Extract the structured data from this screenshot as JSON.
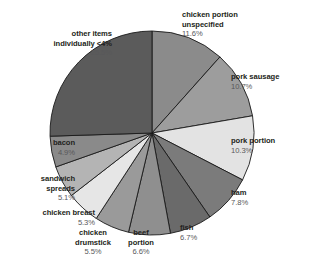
{
  "chart_data": {
    "type": "pie",
    "title": "",
    "subtitle": "",
    "xlabel": "",
    "ylabel": "",
    "legend_position": "none",
    "grid": false,
    "unit": "%",
    "start_angle_deg": 0,
    "direction": "clockwise",
    "categories": [
      "chicken portion unspecified",
      "pork sausage",
      "pork portion",
      "ham",
      "fish",
      "beef portion",
      "chicken drumstick",
      "chicken breast",
      "sandwich spreads",
      "bacon",
      "other items individually <4%"
    ],
    "values": [
      11.6,
      10.7,
      10.3,
      7.8,
      6.7,
      6.6,
      5.5,
      5.3,
      5.1,
      4.9,
      25.5
    ],
    "slices": [
      {
        "id": "chicken-portion-unspecified",
        "label_line1": "chicken portion",
        "label_line2": "unspecified",
        "percent_text": "11.6%",
        "value": 11.6,
        "color": "#8b8b8b"
      },
      {
        "id": "pork-sausage",
        "label_line1": "pork sausage",
        "label_line2": "",
        "percent_text": "10.7%",
        "value": 10.7,
        "color": "#9d9d9d"
      },
      {
        "id": "pork-portion",
        "label_line1": "pork portion",
        "label_line2": "",
        "percent_text": "10.3%",
        "value": 10.3,
        "color": "#e3e3e3"
      },
      {
        "id": "ham",
        "label_line1": "ham",
        "label_line2": "",
        "percent_text": "7.8%",
        "value": 7.8,
        "color": "#7b7b7b"
      },
      {
        "id": "fish",
        "label_line1": "fish",
        "label_line2": "",
        "percent_text": "6.7%",
        "value": 6.7,
        "color": "#6a6a6a"
      },
      {
        "id": "beef-portion",
        "label_line1": "beef",
        "label_line2": "portion",
        "percent_text": "6.6%",
        "value": 6.6,
        "color": "#8f8f8f"
      },
      {
        "id": "chicken-drumstick",
        "label_line1": "chicken",
        "label_line2": "drumstick",
        "percent_text": "5.5%",
        "value": 5.5,
        "color": "#9a9a9a"
      },
      {
        "id": "chicken-breast",
        "label_line1": "chicken breast",
        "label_line2": "",
        "percent_text": "5.3%",
        "value": 5.3,
        "color": "#e6e6e6"
      },
      {
        "id": "sandwich-spreads",
        "label_line1": "sandwich",
        "label_line2": "spreads",
        "percent_text": "5.1%",
        "value": 5.1,
        "color": "#b4b4b4"
      },
      {
        "id": "bacon",
        "label_line1": "bacon",
        "label_line2": "",
        "percent_text": "4.9%",
        "value": 4.9,
        "color": "#8a8a8a"
      },
      {
        "id": "other-items",
        "label_line1": "other items",
        "label_line2": "individually <4%",
        "percent_text": "25.5%",
        "value": 25.5,
        "color": "#5b5b5b"
      }
    ],
    "geometry": {
      "center_x": 152,
      "center_y": 133,
      "radius": 102,
      "stroke_color": "#1a1a1a",
      "stroke_width": 0.9
    }
  }
}
